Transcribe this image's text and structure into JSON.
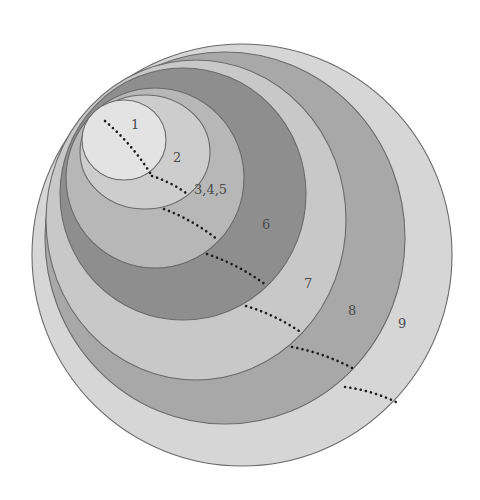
{
  "diagram": {
    "type": "nested-ellipses",
    "background": "#ffffff",
    "regions": [
      {
        "label": "9",
        "cx": 242,
        "cy": 255,
        "rx": 210,
        "ry": 211,
        "fill": "#d6d6d6",
        "label_x": 398,
        "label_y": 328
      },
      {
        "label": "8",
        "cx": 225,
        "cy": 238,
        "rx": 180,
        "ry": 186,
        "fill": "#a8a8a8",
        "label_x": 348,
        "label_y": 315
      },
      {
        "label": "7",
        "cx": 196,
        "cy": 220,
        "rx": 150,
        "ry": 160,
        "fill": "#c8c8c8",
        "label_x": 304,
        "label_y": 288
      },
      {
        "label": "6",
        "cx": 183,
        "cy": 194,
        "rx": 123,
        "ry": 126,
        "fill": "#8e8e8e",
        "label_x": 262,
        "label_y": 229
      },
      {
        "label": "3,4,5",
        "cx": 155,
        "cy": 178,
        "rx": 89,
        "ry": 90,
        "fill": "#b7b7b7",
        "label_x": 194,
        "label_y": 194
      },
      {
        "label": "2",
        "cx": 145,
        "cy": 152,
        "rx": 65,
        "ry": 57,
        "fill": "#cdcdcd",
        "label_x": 173,
        "label_y": 162
      },
      {
        "label": "1",
        "cx": 124,
        "cy": 140,
        "rx": 42,
        "ry": 40,
        "fill": "#e3e3e3",
        "label_x": 131,
        "label_y": 129
      }
    ],
    "dotted_segments": [
      {
        "region": "1",
        "x1": 105,
        "y1": 121,
        "x2": 152,
        "y2": 176
      },
      {
        "region": "2",
        "x1": 152,
        "y1": 176,
        "x2": 186,
        "y2": 193
      },
      {
        "region": "3,4,5",
        "x1": 164,
        "y1": 209,
        "x2": 218,
        "y2": 240
      },
      {
        "region": "6",
        "x1": 207,
        "y1": 254,
        "x2": 266,
        "y2": 285
      },
      {
        "region": "7",
        "x1": 246,
        "y1": 306,
        "x2": 302,
        "y2": 333
      },
      {
        "region": "8",
        "x1": 292,
        "y1": 347,
        "x2": 356,
        "y2": 370
      },
      {
        "region": "9",
        "x1": 345,
        "y1": 387,
        "x2": 396,
        "y2": 402
      }
    ]
  }
}
